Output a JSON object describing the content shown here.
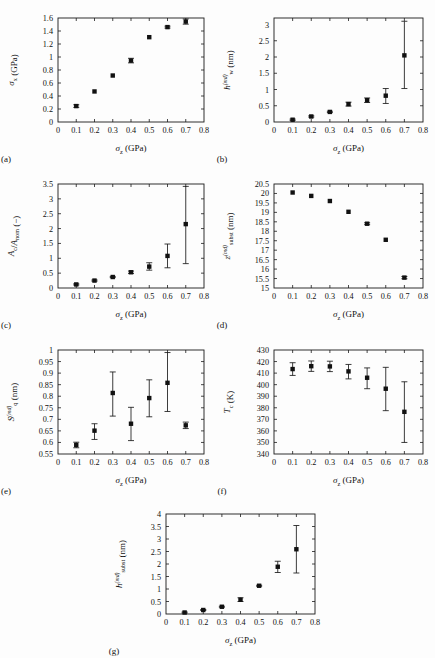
{
  "figure": {
    "background": "#fdfdfd",
    "marker_color": "#111111",
    "axis_color": "#1a1a1a",
    "shared_xlabel_main": "σ",
    "shared_xlabel_sub": "z",
    "shared_xlabel_unit": " (GPa)"
  },
  "chart_data": [
    {
      "id": "a",
      "tag": "(a)",
      "type": "scatter",
      "title": "",
      "xlabel": "σ_z (GPa)",
      "ylabel": "σ_x (GPa)",
      "ylabel_main": "σ",
      "ylabel_sub": "x",
      "ylabel_sup": "",
      "ylabel_unit": " (GPa)",
      "x": [
        0.1,
        0.2,
        0.3,
        0.4,
        0.5,
        0.6,
        0.7
      ],
      "values": [
        0.245,
        0.47,
        0.715,
        0.945,
        1.305,
        1.46,
        1.545
      ],
      "yerr_low": [
        0.02,
        0.0,
        0.0,
        0.035,
        0.0,
        0.015,
        0.04
      ],
      "yerr_high": [
        0.02,
        0.0,
        0.0,
        0.035,
        0.0,
        0.015,
        0.04
      ],
      "xlim": [
        0,
        0.8
      ],
      "ylim": [
        0,
        1.6
      ],
      "xticks": [
        0,
        0.1,
        0.2,
        0.3,
        0.4,
        0.5,
        0.6,
        0.7,
        0.8
      ],
      "xticklabels": [
        "0",
        "0.1",
        "0.2",
        "0.3",
        "0.4",
        "0.5",
        "0.6",
        "0.7",
        "0.8"
      ],
      "yticks": [
        0,
        0.2,
        0.4,
        0.6,
        0.8,
        1.0,
        1.2,
        1.4,
        1.6
      ],
      "yticklabels": [
        "0",
        "0.2",
        "0.4",
        "0.6",
        "0.8",
        "1",
        "1.2",
        "1.4",
        "1.6"
      ],
      "grid": false,
      "legend": "none"
    },
    {
      "id": "b",
      "tag": "(b)",
      "type": "scatter",
      "title": "",
      "xlabel": "σ_z (GPa)",
      "ylabel": "h_w^(md) (nm)",
      "ylabel_main": "h",
      "ylabel_sub": "w",
      "ylabel_sup": "(md)",
      "ylabel_unit": " (nm)",
      "x": [
        0.1,
        0.2,
        0.3,
        0.4,
        0.5,
        0.6,
        0.7
      ],
      "values": [
        0.07,
        0.17,
        0.31,
        0.55,
        0.67,
        0.81,
        2.05
      ],
      "yerr_low": [
        0.02,
        0.02,
        0.02,
        0.06,
        0.07,
        0.24,
        1.02
      ],
      "yerr_high": [
        0.02,
        0.02,
        0.02,
        0.06,
        0.07,
        0.22,
        1.05
      ],
      "xlim": [
        0,
        0.8
      ],
      "ylim": [
        0,
        3.2
      ],
      "xticks": [
        0,
        0.1,
        0.2,
        0.3,
        0.4,
        0.5,
        0.6,
        0.7,
        0.8
      ],
      "xticklabels": [
        "0",
        "0.1",
        "0.2",
        "0.3",
        "0.4",
        "0.5",
        "0.6",
        "0.7",
        "0.8"
      ],
      "yticks": [
        0,
        0.5,
        1.0,
        1.5,
        2.0,
        2.5,
        3.0
      ],
      "yticklabels": [
        "0",
        "0.5",
        "1",
        "1.5",
        "2",
        "2.5",
        "3"
      ],
      "grid": false,
      "legend": "none"
    },
    {
      "id": "c",
      "tag": "(c)",
      "type": "scatter",
      "title": "",
      "xlabel": "σ_z (GPa)",
      "ylabel": "A_c/A_nom (−)",
      "ylabel_main": "A",
      "ylabel_sub": "c",
      "ylabel_sup": "",
      "ylabel_unit": " (−)",
      "x": [
        0.1,
        0.2,
        0.3,
        0.4,
        0.5,
        0.6,
        0.7
      ],
      "values": [
        0.12,
        0.25,
        0.37,
        0.53,
        0.72,
        1.08,
        2.15
      ],
      "yerr_low": [
        0.02,
        0.02,
        0.02,
        0.04,
        0.12,
        0.4,
        1.33
      ],
      "yerr_high": [
        0.02,
        0.02,
        0.02,
        0.04,
        0.13,
        0.4,
        1.27
      ],
      "xlim": [
        0,
        0.8
      ],
      "ylim": [
        0,
        3.5
      ],
      "xticks": [
        0,
        0.1,
        0.2,
        0.3,
        0.4,
        0.5,
        0.6,
        0.7,
        0.8
      ],
      "xticklabels": [
        "0",
        "0.1",
        "0.2",
        "0.3",
        "0.4",
        "0.5",
        "0.6",
        "0.7",
        "0.8"
      ],
      "yticks": [
        0,
        0.5,
        1.0,
        1.5,
        2.0,
        2.5,
        3.0,
        3.5
      ],
      "yticklabels": [
        "0",
        "0.5",
        "1",
        "1.5",
        "2",
        "2.5",
        "3",
        "3.5"
      ],
      "grid": false,
      "legend": "none"
    },
    {
      "id": "d",
      "tag": "(d)",
      "type": "scatter",
      "title": "",
      "xlabel": "σ_z (GPa)",
      "ylabel": "z_subst^(md) (nm)",
      "ylabel_main": "z",
      "ylabel_sub": "subst",
      "ylabel_sup": "(md)",
      "ylabel_unit": " (nm)",
      "x": [
        0.1,
        0.2,
        0.3,
        0.4,
        0.5,
        0.6,
        0.7
      ],
      "values": [
        20.05,
        19.87,
        19.6,
        19.03,
        18.4,
        17.55,
        15.55
      ],
      "yerr_low": [
        0.0,
        0.0,
        0.0,
        0.0,
        0.05,
        0.0,
        0.06
      ],
      "yerr_high": [
        0.0,
        0.0,
        0.0,
        0.0,
        0.05,
        0.0,
        0.06
      ],
      "xlim": [
        0,
        0.8
      ],
      "ylim": [
        15,
        20.5
      ],
      "xticks": [
        0,
        0.1,
        0.2,
        0.3,
        0.4,
        0.5,
        0.6,
        0.7,
        0.8
      ],
      "xticklabels": [
        "0",
        "0.1",
        "0.2",
        "0.3",
        "0.4",
        "0.5",
        "0.6",
        "0.7",
        "0.8"
      ],
      "yticks": [
        15,
        15.5,
        16,
        16.5,
        17,
        17.5,
        18,
        18.5,
        19,
        19.5,
        20,
        20.5
      ],
      "yticklabels": [
        "15",
        "15.5",
        "16",
        "16.5",
        "17",
        "17.5",
        "18",
        "18.5",
        "19",
        "19.5",
        "20",
        "20.5"
      ],
      "grid": false,
      "legend": "none"
    },
    {
      "id": "e",
      "tag": "(e)",
      "type": "scatter",
      "title": "",
      "xlabel": "σ_z (GPa)",
      "ylabel": "S_q^(md) (nm)",
      "ylabel_main": "S",
      "ylabel_sub": "q",
      "ylabel_sup": "(md)",
      "ylabel_unit": " (nm)",
      "x": [
        0.1,
        0.2,
        0.3,
        0.4,
        0.5,
        0.6,
        0.7
      ],
      "values": [
        0.589,
        0.651,
        0.814,
        0.681,
        0.792,
        0.858,
        0.674
      ],
      "yerr_low": [
        0.012,
        0.038,
        0.1,
        0.073,
        0.081,
        0.124,
        0.014
      ],
      "yerr_high": [
        0.012,
        0.03,
        0.091,
        0.071,
        0.079,
        0.131,
        0.014
      ],
      "xlim": [
        0,
        0.8
      ],
      "ylim": [
        0.55,
        1.0
      ],
      "xticks": [
        0,
        0.1,
        0.2,
        0.3,
        0.4,
        0.5,
        0.6,
        0.7,
        0.8
      ],
      "xticklabels": [
        "0",
        "0.1",
        "0.2",
        "0.3",
        "0.4",
        "0.5",
        "0.6",
        "0.7",
        "0.8"
      ],
      "yticks": [
        0.55,
        0.6,
        0.65,
        0.7,
        0.75,
        0.8,
        0.85,
        0.9,
        0.95,
        1.0
      ],
      "yticklabels": [
        "0.55",
        "0.6",
        "0.65",
        "0.7",
        "0.75",
        "0.8",
        "0.85",
        "0.9",
        "0.95",
        "1"
      ],
      "grid": false,
      "legend": "none"
    },
    {
      "id": "f",
      "tag": "(f)",
      "type": "scatter",
      "title": "",
      "xlabel": "σ_z (GPa)",
      "ylabel": "T_c (K)",
      "ylabel_main": "T",
      "ylabel_sub": "c",
      "ylabel_sup": "",
      "ylabel_unit": " (K)",
      "x": [
        0.1,
        0.2,
        0.3,
        0.4,
        0.5,
        0.6,
        0.7
      ],
      "values": [
        413.5,
        416.0,
        415.8,
        411.5,
        406.0,
        396.5,
        376.5
      ],
      "yerr_low": [
        5.5,
        4.5,
        4.5,
        6.5,
        9.5,
        19.0,
        26.5
      ],
      "yerr_high": [
        5.5,
        4.5,
        4.5,
        6.0,
        8.5,
        18.5,
        26.0
      ],
      "xlim": [
        0,
        0.8
      ],
      "ylim": [
        340,
        430
      ],
      "xticks": [
        0,
        0.1,
        0.2,
        0.3,
        0.4,
        0.5,
        0.6,
        0.7,
        0.8
      ],
      "xticklabels": [
        "0",
        "0.1",
        "0.2",
        "0.3",
        "0.4",
        "0.5",
        "0.6",
        "0.7",
        "0.8"
      ],
      "yticks": [
        340,
        350,
        360,
        370,
        380,
        390,
        400,
        410,
        420,
        430
      ],
      "yticklabels": [
        "340",
        "350",
        "360",
        "370",
        "380",
        "390",
        "400",
        "410",
        "420",
        "430"
      ],
      "grid": false,
      "legend": "none"
    },
    {
      "id": "g",
      "tag": "(g)",
      "type": "scatter",
      "title": "",
      "xlabel": "σ_z (GPa)",
      "ylabel": "h_subst^(md) (nm)",
      "ylabel_main": "h",
      "ylabel_sub": "subst",
      "ylabel_sup": "(md)",
      "ylabel_unit": " (nm)",
      "x": [
        0.1,
        0.2,
        0.3,
        0.4,
        0.5,
        0.6,
        0.7
      ],
      "values": [
        0.06,
        0.16,
        0.29,
        0.57,
        1.13,
        1.89,
        2.59
      ],
      "yerr_low": [
        0.02,
        0.02,
        0.02,
        0.07,
        0.02,
        0.23,
        0.95
      ],
      "yerr_high": [
        0.02,
        0.02,
        0.02,
        0.08,
        0.02,
        0.22,
        0.95
      ],
      "xlim": [
        0,
        0.8
      ],
      "ylim": [
        0,
        4.0
      ],
      "xticks": [
        0,
        0.1,
        0.2,
        0.3,
        0.4,
        0.5,
        0.6,
        0.7,
        0.8
      ],
      "xticklabels": [
        "0",
        "0.1",
        "0.2",
        "0.3",
        "0.4",
        "0.5",
        "0.6",
        "0.7",
        "0.8"
      ],
      "yticks": [
        0,
        0.5,
        1.0,
        1.5,
        2.0,
        2.5,
        3.0,
        3.5,
        4.0
      ],
      "yticklabels": [
        "0",
        "0.5",
        "1",
        "1.5",
        "2",
        "2.5",
        "3",
        "3.5",
        "4"
      ],
      "grid": false,
      "legend": "none"
    }
  ]
}
